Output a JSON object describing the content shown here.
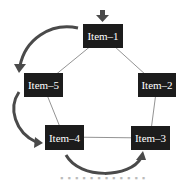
{
  "diagram": {
    "nodes": [
      {
        "id": "n1",
        "label": "Item–1",
        "x": 83,
        "y": 24,
        "w": 40,
        "h": 24
      },
      {
        "id": "n2",
        "label": "Item–2",
        "x": 138,
        "y": 73,
        "w": 38,
        "h": 24
      },
      {
        "id": "n3",
        "label": "Item–3",
        "x": 131,
        "y": 126,
        "w": 39,
        "h": 24
      },
      {
        "id": "n4",
        "label": "Item–4",
        "x": 45,
        "y": 125,
        "w": 39,
        "h": 25
      },
      {
        "id": "n5",
        "label": "Item–5",
        "x": 24,
        "y": 73,
        "w": 39,
        "h": 24
      }
    ],
    "edges": [
      [
        "n1",
        "n2"
      ],
      [
        "n2",
        "n3"
      ],
      [
        "n3",
        "n4"
      ],
      [
        "n4",
        "n5"
      ],
      [
        "n5",
        "n1"
      ]
    ],
    "flow_arrows": [
      "entry into Item-1",
      "Item-1 to Item-5",
      "Item-5 to Item-4",
      "Item-4 to Item-3"
    ],
    "colors": {
      "node_bg": "#1c1c1c",
      "node_text": "#ffffff",
      "edge": "#777777",
      "arrow": "#4a4a4a"
    }
  }
}
